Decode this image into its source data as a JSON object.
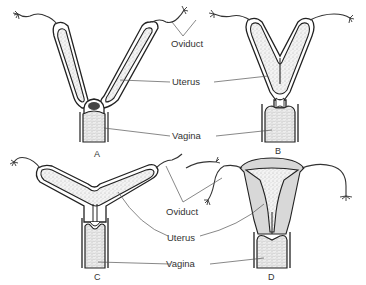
{
  "figure": {
    "panels": [
      {
        "id": "A",
        "letter": "A",
        "type": "duplex"
      },
      {
        "id": "B",
        "letter": "B",
        "type": "bipartite"
      },
      {
        "id": "C",
        "letter": "C",
        "type": "bicornuate"
      },
      {
        "id": "D",
        "letter": "D",
        "type": "simplex"
      }
    ],
    "labels_top": {
      "oviduct": "Oviduct",
      "uterus": "Uterus",
      "vagina": "Vagina"
    },
    "labels_bottom": {
      "oviduct": "Oviduct",
      "uterus": "Uterus",
      "vagina": "Vagina"
    }
  },
  "colors": {
    "background": "#ffffff",
    "line": "#222222",
    "label_text": "#333333",
    "gray_fill": "#d8d8d8"
  }
}
